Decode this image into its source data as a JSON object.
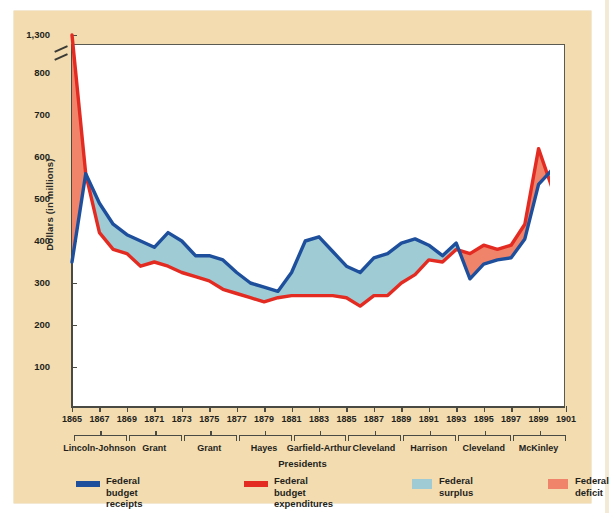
{
  "chart_data": {
    "type": "area",
    "title": "",
    "xlabel": "Presidents",
    "ylabel": "Dollars (in millions)",
    "ylim": [
      0,
      850
    ],
    "y_axis_break": true,
    "yticks": [
      "100",
      "200",
      "300",
      "400",
      "500",
      "600",
      "700",
      "800",
      "1,300"
    ],
    "xticks": [
      "1865",
      "1867",
      "1869",
      "1871",
      "1873",
      "1875",
      "1877",
      "1879",
      "1881",
      "1883",
      "1885",
      "1887",
      "1889",
      "1891",
      "1893",
      "1895",
      "1897",
      "1899",
      "1901"
    ],
    "x": [
      1865,
      1866,
      1867,
      1868,
      1869,
      1870,
      1871,
      1872,
      1873,
      1874,
      1875,
      1876,
      1877,
      1878,
      1879,
      1880,
      1881,
      1882,
      1883,
      1884,
      1885,
      1886,
      1887,
      1888,
      1889,
      1890,
      1891,
      1892,
      1893,
      1894,
      1895,
      1896,
      1897,
      1898,
      1899,
      1900,
      1901
    ],
    "series": [
      {
        "name": "Federal budget receipts",
        "color": "#1d4f9c",
        "values": [
          350,
          560,
          490,
          440,
          415,
          400,
          385,
          420,
          400,
          365,
          365,
          355,
          325,
          300,
          290,
          280,
          325,
          400,
          410,
          375,
          340,
          325,
          360,
          370,
          395,
          405,
          390,
          365,
          395,
          310,
          345,
          355,
          360,
          405,
          535,
          570,
          590
        ]
      },
      {
        "name": "Federal budget expenditures",
        "color": "#e32b22",
        "values": [
          1300,
          560,
          420,
          380,
          370,
          340,
          350,
          340,
          325,
          315,
          305,
          285,
          275,
          265,
          255,
          265,
          270,
          270,
          270,
          270,
          265,
          245,
          270,
          270,
          300,
          320,
          355,
          350,
          380,
          370,
          390,
          380,
          390,
          440,
          620,
          525,
          525
        ]
      }
    ],
    "fills": [
      {
        "name": "Federal surplus",
        "color": "#9fcbd4"
      },
      {
        "name": "Federal deficit",
        "color": "#f0846b"
      }
    ],
    "presidents": [
      {
        "label": "Lincoln-Johnson",
        "start": 1865,
        "end": 1869
      },
      {
        "label": "Grant",
        "start": 1869,
        "end": 1873
      },
      {
        "label": "Grant",
        "start": 1873,
        "end": 1877
      },
      {
        "label": "Hayes",
        "start": 1877,
        "end": 1881
      },
      {
        "label": "Garfield-Arthur",
        "start": 1881,
        "end": 1885
      },
      {
        "label": "Cleveland",
        "start": 1885,
        "end": 1889
      },
      {
        "label": "Harrison",
        "start": 1889,
        "end": 1893
      },
      {
        "label": "Cleveland",
        "start": 1893,
        "end": 1897
      },
      {
        "label": "McKinley",
        "start": 1897,
        "end": 1901
      }
    ]
  },
  "legend": {
    "items": [
      {
        "label": "Federal budget\nreceipts",
        "color": "#1d4f9c",
        "kind": "line"
      },
      {
        "label": "Federal budget\nexpenditures",
        "color": "#e32b22",
        "kind": "line"
      },
      {
        "label": "Federal surplus",
        "color": "#9fcbd4",
        "kind": "area"
      },
      {
        "label": "Federal deficit",
        "color": "#f0846b",
        "kind": "area"
      }
    ]
  },
  "colors": {
    "panel": "#f2dcb0",
    "plot": "#ffffff",
    "receipts": "#1d4f9c",
    "expenditures": "#e32b22",
    "surplus": "#9fcbd4",
    "deficit": "#f0846b"
  }
}
